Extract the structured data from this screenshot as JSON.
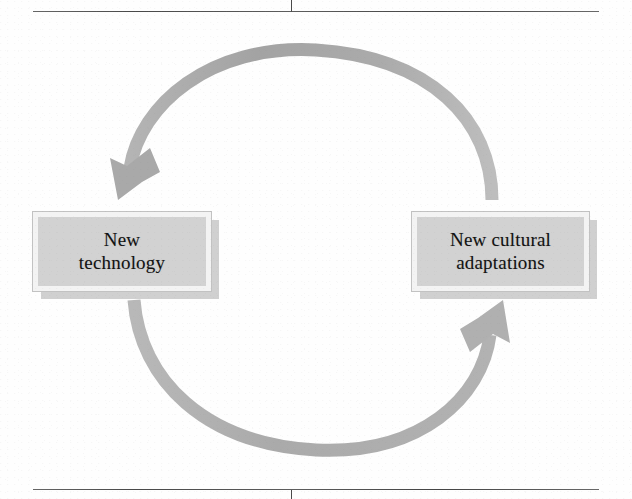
{
  "figure": {
    "type": "cycle-diagram",
    "background_color": "#fefefe",
    "arrow_color": "#a9a9a9",
    "box_fill_color": "#d2d2d2",
    "box_border_color": "#f3f3f3",
    "text_color": "#121212"
  },
  "nodes": [
    {
      "id": "technology",
      "label": "New\ntechnology",
      "line1": "New",
      "line2": "technology",
      "position": "left"
    },
    {
      "id": "adaptations",
      "label": "New cultural\nadaptations",
      "line1": "New cultural",
      "line2": "adaptations",
      "position": "right"
    }
  ],
  "arrows": [
    {
      "id": "top-arrow",
      "from": "adaptations",
      "to": "technology",
      "direction": "counterclockwise-over-top",
      "arrowhead": "down-left"
    },
    {
      "id": "bottom-arrow",
      "from": "technology",
      "to": "adaptations",
      "direction": "clockwise-under-bottom",
      "arrowhead": "up-right"
    }
  ],
  "page_marks": {
    "top_rule": true,
    "bottom_rule": true,
    "top_tick": true,
    "bottom_tick": true
  }
}
